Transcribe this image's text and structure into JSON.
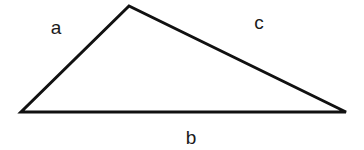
{
  "diagram": {
    "type": "triangle",
    "stroke_color": "#111111",
    "stroke_width": 3,
    "vertices": {
      "top": {
        "x": 129,
        "y": 6
      },
      "left": {
        "x": 21,
        "y": 112
      },
      "right": {
        "x": 346,
        "y": 112
      }
    },
    "labels": {
      "a": {
        "text": "a",
        "x": 56,
        "y": 27
      },
      "c": {
        "text": "c",
        "x": 259,
        "y": 22
      },
      "b": {
        "text": "b",
        "x": 191,
        "y": 137
      }
    }
  }
}
